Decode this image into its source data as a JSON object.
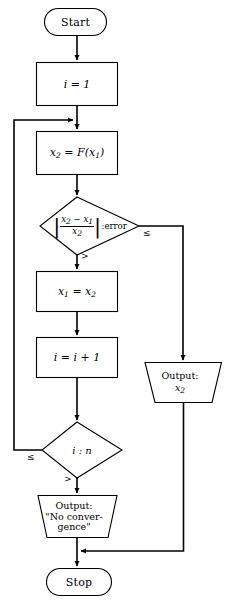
{
  "diagram": {
    "type": "flowchart",
    "stroke_color": "#000000",
    "fill_color": "#ffffff",
    "nodes": [
      {
        "id": "start",
        "shape": "terminator",
        "label": "Start"
      },
      {
        "id": "init",
        "shape": "process",
        "label": "i = 1"
      },
      {
        "id": "iterate",
        "shape": "process",
        "label": "x2 = F(x1)"
      },
      {
        "id": "test_err",
        "shape": "decision",
        "label": "|x2 - x1| / x2 : error"
      },
      {
        "id": "assign",
        "shape": "process",
        "label": "x1 = x2"
      },
      {
        "id": "incr",
        "shape": "process",
        "label": "i = i + 1"
      },
      {
        "id": "test_n",
        "shape": "decision",
        "label": "i : n"
      },
      {
        "id": "out_x2",
        "shape": "output",
        "label_line1": "Output:",
        "label_line2": "x2"
      },
      {
        "id": "out_fail",
        "shape": "output",
        "label_line1": "Output:",
        "label_line2": "\"No conver-",
        "label_line3": "gence\""
      },
      {
        "id": "stop",
        "shape": "terminator",
        "label": "Stop"
      }
    ],
    "edge_labels": {
      "err_le": "≤",
      "err_gt": ">",
      "n_le": "≤",
      "n_gt": ">"
    },
    "math": {
      "init_var": "i",
      "init_val": "1",
      "x2": "x",
      "x2_sub": "2",
      "x1": "x",
      "x1_sub": "1",
      "func": "F",
      "error_word": ":error",
      "incr_text": "i = i + 1",
      "in_label": "i",
      "n_label": "n",
      "colon": ":"
    }
  }
}
